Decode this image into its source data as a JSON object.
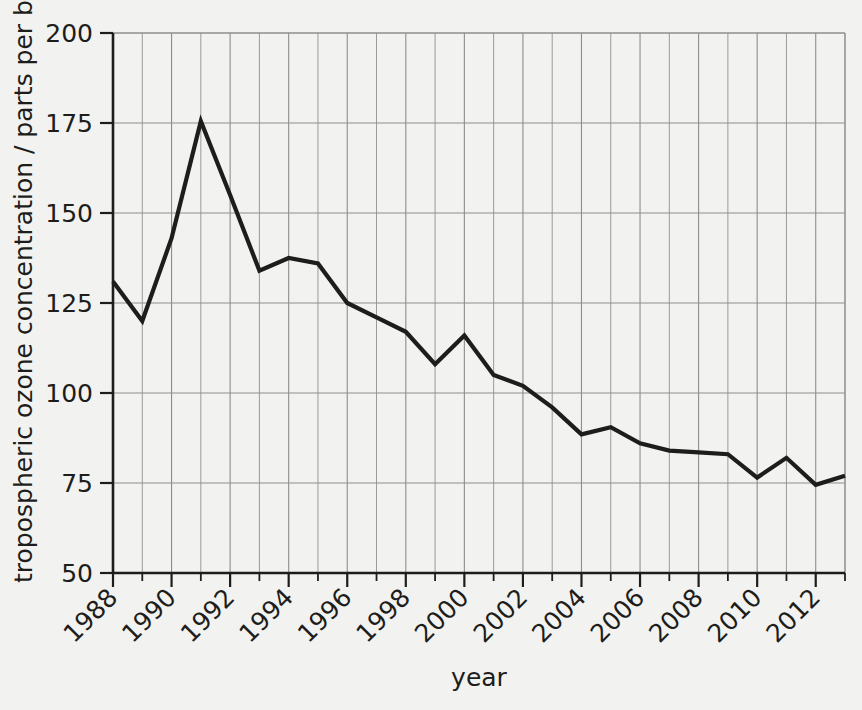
{
  "chart_data": {
    "type": "line",
    "title": "",
    "subtitle": "",
    "xlabel": "year",
    "ylabel": "tropospheric ozone concentration / parts per billion",
    "xlim": [
      1988,
      2013
    ],
    "ylim": [
      50,
      200
    ],
    "grid": "both-axes major and minor vertical",
    "legend": "none",
    "x_tick_labels": [
      "1988",
      "1990",
      "1992",
      "1994",
      "1996",
      "1998",
      "2000",
      "2002",
      "2004",
      "2006",
      "2008",
      "2010",
      "2012"
    ],
    "x_tick_values": [
      1988,
      1990,
      1992,
      1994,
      1996,
      1998,
      2000,
      2002,
      2004,
      2006,
      2008,
      2010,
      2012
    ],
    "x_minor_ticks": [
      1989,
      1991,
      1993,
      1995,
      1997,
      1999,
      2001,
      2003,
      2005,
      2007,
      2009,
      2011,
      2013
    ],
    "y_tick_labels": [
      "50",
      "75",
      "100",
      "125",
      "150",
      "175",
      "200"
    ],
    "y_tick_values": [
      50,
      75,
      100,
      125,
      150,
      175,
      200
    ],
    "x": [
      1988,
      1989,
      1990,
      1991,
      1992,
      1993,
      1994,
      1995,
      1996,
      1997,
      1998,
      1999,
      2000,
      2001,
      2002,
      2003,
      2004,
      2005,
      2006,
      2007,
      2008,
      2009,
      2010,
      2011,
      2012,
      2013
    ],
    "values": [
      131,
      120,
      143,
      175.5,
      155,
      134,
      137.5,
      136,
      125,
      121,
      117,
      108,
      116,
      105,
      102,
      96,
      88.5,
      90.5,
      86,
      84,
      83.5,
      83,
      76.5,
      82,
      74.5,
      77
    ],
    "series": [
      {
        "name": "tropospheric ozone concentration",
        "values": [
          131,
          120,
          143,
          175.5,
          155,
          134,
          137.5,
          136,
          125,
          121,
          117,
          108,
          116,
          105,
          102,
          96,
          88.5,
          90.5,
          86,
          84,
          83.5,
          83,
          76.5,
          82,
          74.5,
          77
        ]
      }
    ],
    "colors": {
      "line": "#1d1d1b",
      "grid": "#8d8d8d",
      "axis": "#1d1d1b",
      "background": "#f2f2f0"
    }
  }
}
